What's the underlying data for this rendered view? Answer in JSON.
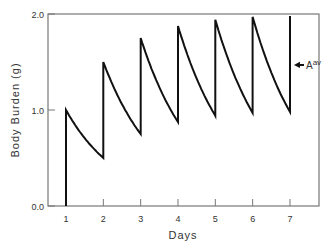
{
  "chart_data": {
    "type": "line",
    "title": "",
    "xlabel": "Days",
    "ylabel": "Body Burden (g)",
    "xlim": [
      0.5,
      7.75
    ],
    "ylim": [
      0.0,
      2.0
    ],
    "x_ticks": [
      1,
      2,
      3,
      4,
      5,
      6,
      7
    ],
    "y_ticks": [
      "0.0",
      "1.0",
      "2.0"
    ],
    "grid": false,
    "legend": null,
    "annotation": {
      "text": "A",
      "superscript": "av",
      "arrow": "left",
      "x": 7,
      "y": 1.47
    },
    "series": [
      {
        "name": "Body burden (repeated daily dose, 1-day half-life)",
        "points": [
          [
            1,
            0.0
          ],
          [
            1,
            1.0
          ],
          [
            2,
            0.5
          ],
          [
            2,
            1.5
          ],
          [
            3,
            0.75
          ],
          [
            3,
            1.75
          ],
          [
            4,
            0.875
          ],
          [
            4,
            1.875
          ],
          [
            5,
            0.94
          ],
          [
            5,
            1.94
          ],
          [
            6,
            0.97
          ],
          [
            6,
            1.97
          ],
          [
            7,
            0.98
          ],
          [
            7,
            1.98
          ]
        ]
      }
    ]
  },
  "colors": {
    "line": "#111111",
    "axis": "#777777",
    "text": "#333333",
    "background": "#ffffff"
  }
}
